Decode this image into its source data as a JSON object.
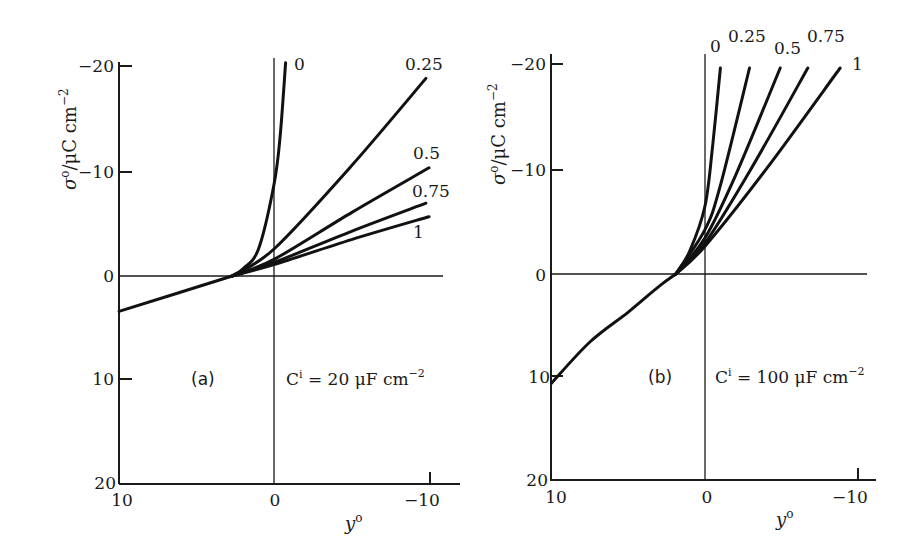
{
  "chart_data": [
    {
      "type": "line",
      "panel": "(a)",
      "annotation": "Cⁱ = 20 μF cm⁻²",
      "annotation_parts": {
        "c": "C",
        "sup": "i",
        "rest": " = 20 μF cm",
        "exp": "−2"
      },
      "xlabel": "y°",
      "ylabel": "σ°/μC cm⁻²",
      "xlim": [
        10,
        -10
      ],
      "ylim": [
        20,
        -20
      ],
      "x_ticks": [
        "10",
        "0",
        "−10"
      ],
      "y_ticks": [
        "−20",
        "−10",
        "0",
        "10",
        "20"
      ],
      "grid": false,
      "common_branch": {
        "x": [
          10,
          2.7
        ],
        "y": [
          3.4,
          0
        ]
      },
      "series": [
        {
          "name": "0",
          "x": [
            2.7,
            2,
            1,
            0,
            -0.4,
            -0.75
          ],
          "y": [
            0,
            -0.7,
            -2.6,
            -8.8,
            -13.5,
            -20.5
          ]
        },
        {
          "name": "0.25",
          "x": [
            2.7,
            0,
            -5,
            -9.8
          ],
          "y": [
            0,
            -2.6,
            -10.6,
            -19
          ]
        },
        {
          "name": "0.5",
          "x": [
            2.7,
            0,
            -5,
            -10
          ],
          "y": [
            0,
            -1.6,
            -6.1,
            -10.4
          ]
        },
        {
          "name": "0.75",
          "x": [
            2.7,
            0,
            -5,
            -9.8
          ],
          "y": [
            0,
            -1.3,
            -4.3,
            -7
          ]
        },
        {
          "name": "1",
          "x": [
            2.7,
            0,
            -5,
            -10
          ],
          "y": [
            0,
            -1.1,
            -3.5,
            -5.7
          ]
        }
      ]
    },
    {
      "type": "line",
      "panel": "(b)",
      "annotation": "Cⁱ = 100 μF cm⁻²",
      "annotation_parts": {
        "c": "C",
        "sup": "i",
        "rest": " = 100 μF cm",
        "exp": "−2"
      },
      "xlabel": "y°",
      "ylabel": "σ°/μC cm⁻²",
      "xlim": [
        10,
        -10
      ],
      "ylim": [
        20,
        -20
      ],
      "x_ticks": [
        "10",
        "0",
        "−10"
      ],
      "y_ticks": [
        "−20",
        "−10",
        "0",
        "10",
        "20"
      ],
      "grid": false,
      "common_branch": {
        "x": [
          10,
          7.5,
          5,
          3,
          1.9
        ],
        "y": [
          10.6,
          6.6,
          3.7,
          1.2,
          0
        ]
      },
      "series": [
        {
          "name": "0",
          "x": [
            1.9,
            1,
            0,
            -0.5,
            -1.0
          ],
          "y": [
            0,
            -2.2,
            -6.6,
            -12.5,
            -20
          ]
        },
        {
          "name": "0.25",
          "x": [
            1.9,
            0,
            -1,
            -2.9
          ],
          "y": [
            0,
            -4.3,
            -8.6,
            -20
          ]
        },
        {
          "name": "0.5",
          "x": [
            1.9,
            0,
            -2,
            -4.9
          ],
          "y": [
            0,
            -3.5,
            -9.6,
            -20
          ]
        },
        {
          "name": "0.75",
          "x": [
            1.9,
            0,
            -3,
            -6.7
          ],
          "y": [
            0,
            -3,
            -10.2,
            -20
          ]
        },
        {
          "name": "1",
          "x": [
            1.9,
            0,
            -4,
            -8.8
          ],
          "y": [
            0,
            -2.7,
            -10.2,
            -20
          ]
        }
      ]
    }
  ],
  "panels": {
    "a": {
      "label": "(a)",
      "annot_c": "C",
      "annot_sup": "i",
      "annot_rest": " = 20 μF cm",
      "annot_exp": "−2",
      "xlabel": "y",
      "xlabel_sup": "o",
      "ylabel_sigma": "σ",
      "ylabel_sup": "o",
      "ylabel_rest": "/μC cm",
      "ylabel_exp": "−2",
      "curve_labels": [
        "0",
        "0.25",
        "0.5",
        "0.75",
        "1"
      ],
      "y_ticks": [
        "−20",
        "−10",
        "0",
        "10",
        "20"
      ],
      "x_ticks": [
        "10",
        "0",
        "−10"
      ]
    },
    "b": {
      "label": "(b)",
      "annot_c": "C",
      "annot_sup": "i",
      "annot_rest": " = 100 μF cm",
      "annot_exp": "−2",
      "xlabel": "y",
      "xlabel_sup": "o",
      "ylabel_sigma": "σ",
      "ylabel_sup": "o",
      "ylabel_rest": "/μC cm",
      "ylabel_exp": "−2",
      "curve_labels": [
        "0",
        "0.25",
        "0.5",
        "0.75",
        "1"
      ],
      "y_ticks": [
        "−20",
        "−10",
        "0",
        "10",
        "20"
      ],
      "x_ticks": [
        "10",
        "0",
        "−10"
      ]
    }
  }
}
